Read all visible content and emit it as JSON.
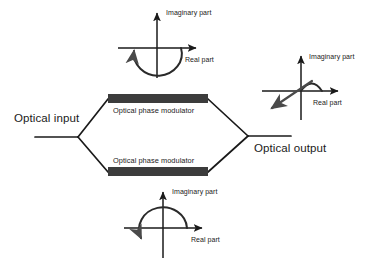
{
  "diagram": {
    "colors": {
      "line": "#1a1a1a",
      "modulator_bar": "#3c3c3c",
      "background": "#ffffff"
    },
    "ports": {
      "input_label": "Optical input",
      "output_label": "Optical output"
    },
    "arms": [
      {
        "id": "upper-arm",
        "modulator_label": "Optical phase modulator"
      },
      {
        "id": "lower-arm",
        "modulator_label": "Optical phase modulator"
      }
    ],
    "insets": [
      {
        "id": "upper-inset",
        "imaginary_label": "Imaginary part",
        "real_label": "Real part",
        "phasor": "semicircular rotation arc, counterclockwise, arrowhead upper-left"
      },
      {
        "id": "lower-inset",
        "imaginary_label": "Imaginary part",
        "real_label": "Real part",
        "phasor": "semicircular rotation arc, counterclockwise, arrowhead lower-left"
      },
      {
        "id": "output-inset",
        "imaginary_label": "Imaginary part",
        "real_label": "Real part",
        "phasor": "resultant vector pointing down-left into third quadrant with small hump arc"
      }
    ]
  }
}
